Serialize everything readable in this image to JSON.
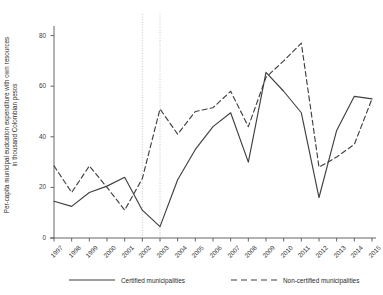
{
  "chart_data": {
    "type": "line",
    "title": "",
    "xlabel": "",
    "ylabel": "Per-capita municipal eudcation expenditure with own resources in thousand Colombian pesos",
    "ylabel_line1": "Per-capita municipal eudcation expenditure with own resources",
    "ylabel_line2": "in thousand Colombian pesos",
    "categories": [
      "1997",
      "1998",
      "1999",
      "2000",
      "2001",
      "2002",
      "2003",
      "2004",
      "2005",
      "2006",
      "2007",
      "2008",
      "2009",
      "2010",
      "2011",
      "2012",
      "2013",
      "2014",
      "2015"
    ],
    "x": [
      1997,
      1998,
      1999,
      2000,
      2001,
      2002,
      2003,
      2004,
      2005,
      2006,
      2007,
      2008,
      2009,
      2010,
      2011,
      2012,
      2013,
      2014,
      2015
    ],
    "series": [
      {
        "name": "Certified municipalities",
        "style": "solid",
        "color": "#404040",
        "values": [
          14.5,
          12.5,
          18.0,
          20.5,
          24.0,
          11.0,
          4.5,
          23.0,
          35.0,
          44.0,
          49.5,
          30.0,
          65.5,
          58.0,
          49.5,
          16.0,
          42.5,
          56.0,
          55.0
        ]
      },
      {
        "name": "Non-certified municipalities",
        "style": "dashed",
        "color": "#404040",
        "values": [
          28.5,
          18.0,
          28.5,
          20.0,
          11.0,
          23.5,
          51.0,
          41.0,
          50.0,
          51.5,
          58.0,
          44.0,
          63.5,
          70.0,
          77.0,
          28.0,
          32.0,
          37.0,
          55.0
        ]
      }
    ],
    "ylim": [
      0,
      83
    ],
    "yticks": [
      0,
      20,
      40,
      60,
      80
    ],
    "ytick_labels": [
      "0",
      "20",
      "40",
      "60",
      "80"
    ],
    "grid": false,
    "legend_position": "bottom",
    "annotations": [
      {
        "type": "vline",
        "x": 2002,
        "style": "dotted",
        "color": "#b8b8b8"
      },
      {
        "type": "vline",
        "x": 2003,
        "style": "dotted",
        "color": "#b8b8b8"
      }
    ]
  },
  "legend": {
    "items": [
      {
        "label": "Certified municipalities",
        "style": "solid"
      },
      {
        "label": "Non-certified municipalities",
        "style": "dashed"
      }
    ]
  }
}
